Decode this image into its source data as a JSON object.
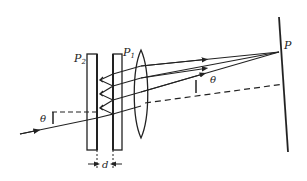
{
  "diagram": {
    "labels": {
      "plate_2": "P",
      "plate_2_sub": "2",
      "plate_1": "P",
      "plate_1_sub": "1",
      "screen_point": "P",
      "angle_incident": "θ",
      "angle_exit": "θ",
      "separation": "d"
    },
    "components": [
      {
        "id": "plate-p2",
        "type": "glass plate",
        "label": "P2"
      },
      {
        "id": "plate-p1",
        "type": "glass plate",
        "label": "P1"
      },
      {
        "id": "lens",
        "type": "convex lens"
      },
      {
        "id": "screen",
        "type": "screen",
        "point": "P"
      }
    ],
    "colors": {
      "ink": "#222222",
      "background": "#ffffff"
    }
  }
}
